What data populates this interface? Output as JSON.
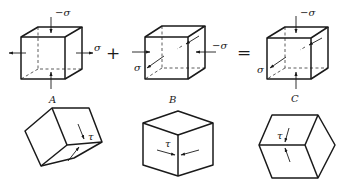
{
  "diagram": {
    "equation": {
      "plus": "+",
      "equals": "="
    },
    "top_row": [
      {
        "caption": "A",
        "stresses": {
          "top_bottom": "−σ",
          "left_right": "σ"
        }
      },
      {
        "caption": "B",
        "stresses": {
          "left_right": "−σ",
          "front_back": "σ"
        }
      },
      {
        "caption": "C",
        "stresses": {
          "top_bottom": "−σ",
          "front_back": "σ"
        }
      }
    ],
    "bottom_row": [
      {
        "shear_label": "τ"
      },
      {
        "shear_label": "τ"
      },
      {
        "shear_label": "τ"
      }
    ]
  }
}
